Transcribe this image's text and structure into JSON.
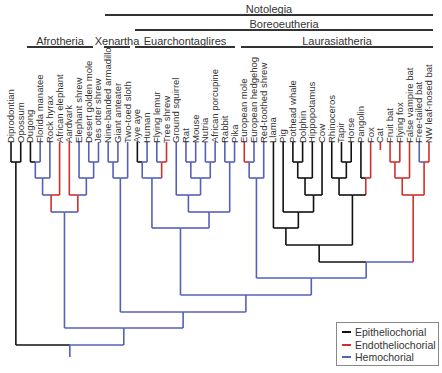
{
  "clades": [
    {
      "label": "Notolegia",
      "x1": 105,
      "x2": 433,
      "y_bar": 14,
      "y_label": 3
    },
    {
      "label": "Boreoeutheria",
      "x1": 135,
      "x2": 433,
      "y_bar": 29,
      "y_label": 18
    },
    {
      "label": "Afrotheria",
      "x1": 27,
      "x2": 93,
      "y_bar": 46,
      "y_label": 35
    },
    {
      "label": "Xenartha",
      "x1": 104,
      "x2": 130,
      "y_bar": 46,
      "y_label": 35
    },
    {
      "label": "Euarchontaglires",
      "x1": 135,
      "x2": 235,
      "y_bar": 46,
      "y_label": 35
    },
    {
      "label": "Laurasiatheria",
      "x1": 241,
      "x2": 433,
      "y_bar": 46,
      "y_label": 35
    }
  ],
  "taxa": [
    {
      "name": "Diprodontian",
      "type": "E"
    },
    {
      "name": "Opossum",
      "type": "E"
    },
    {
      "name": "Dugong",
      "type": "E"
    },
    {
      "name": "Florida manatee",
      "type": "H"
    },
    {
      "name": "Rock hyrax",
      "type": "H"
    },
    {
      "name": "African elephant",
      "type": "N"
    },
    {
      "name": "Aardvark",
      "type": "N"
    },
    {
      "name": "Elephant shrew",
      "type": "H"
    },
    {
      "name": "Desert golden mole",
      "type": "H"
    },
    {
      "name": "Jes otter shrew",
      "type": "H"
    },
    {
      "name": "Nine-banded armadillo",
      "type": "H"
    },
    {
      "name": "Giant anteater",
      "type": "H"
    },
    {
      "name": "Two-toed sloth",
      "type": "H"
    },
    {
      "name": "Aye aye",
      "type": "E"
    },
    {
      "name": "Human",
      "type": "H"
    },
    {
      "name": "Flying lemur",
      "type": "H"
    },
    {
      "name": "Tree shrew",
      "type": "N"
    },
    {
      "name": "Ground squirrel",
      "type": "H"
    },
    {
      "name": "Rat",
      "type": "H"
    },
    {
      "name": "Mouse",
      "type": "H"
    },
    {
      "name": "Nutria",
      "type": "H"
    },
    {
      "name": "African porcupine",
      "type": "H"
    },
    {
      "name": "Rabbit",
      "type": "H"
    },
    {
      "name": "Pika",
      "type": "H"
    },
    {
      "name": "European mole",
      "type": "N"
    },
    {
      "name": "European hedgehog",
      "type": "H"
    },
    {
      "name": "Red-toothed shrew",
      "type": "H"
    },
    {
      "name": "Llama",
      "type": "E"
    },
    {
      "name": "Pig",
      "type": "E"
    },
    {
      "name": "Pothead whale",
      "type": "E"
    },
    {
      "name": "Dolphin",
      "type": "E"
    },
    {
      "name": "Hippopotamus",
      "type": "E"
    },
    {
      "name": "Cow",
      "type": "E"
    },
    {
      "name": "Rhinoceros",
      "type": "E"
    },
    {
      "name": "Tapir",
      "type": "E"
    },
    {
      "name": "Horse",
      "type": "E"
    },
    {
      "name": "Pangolin",
      "type": "E"
    },
    {
      "name": "Fox",
      "type": "N"
    },
    {
      "name": "Cat",
      "type": "N"
    },
    {
      "name": "Fruit bat",
      "type": "N"
    },
    {
      "name": "Flying fox",
      "type": "N"
    },
    {
      "name": "False vampire bat",
      "type": "N"
    },
    {
      "name": "Free-tailed bat",
      "type": "H"
    },
    {
      "name": "NW leaf-nosed bat",
      "type": "N"
    }
  ],
  "legend": {
    "items": [
      {
        "key": "E",
        "label": "Epitheliochorial",
        "color": "#111111"
      },
      {
        "key": "N",
        "label": "Endotheliochorial",
        "color": "#d0302a"
      },
      {
        "key": "H",
        "label": "Hemochorial",
        "color": "#5560b8"
      }
    ]
  },
  "layout": {
    "tip_x0": 11,
    "tip_dx": 9.72,
    "tip_y": 150,
    "label_bottom": 143
  },
  "tree": [
    [
      "E",
      0,
      1,
      162,
      "a"
    ],
    [
      "E",
      2,
      3,
      162,
      "b",
      "H"
    ],
    [
      "H",
      "b",
      4,
      178,
      "c"
    ],
    [
      "H",
      "c",
      5,
      195,
      "d",
      "N"
    ],
    [
      "H",
      8,
      9,
      162,
      "e"
    ],
    [
      "H",
      "e",
      7,
      178,
      "f"
    ],
    [
      "H",
      "f",
      6,
      195,
      "g",
      "N"
    ],
    [
      "H",
      "d",
      "g",
      212,
      "afro"
    ],
    [
      "H",
      10,
      11,
      162,
      "x1"
    ],
    [
      "H",
      "x1",
      12,
      178,
      "xen"
    ],
    [
      "E",
      13,
      14,
      162,
      "p1",
      "H"
    ],
    [
      "H",
      15,
      16,
      162,
      "p2",
      "N"
    ],
    [
      "H",
      "p1",
      "p2",
      178,
      "prim"
    ],
    [
      "H",
      18,
      19,
      162,
      "r1"
    ],
    [
      "H",
      20,
      21,
      162,
      "r2"
    ],
    [
      "H",
      "r1",
      "r2",
      178,
      "r3"
    ],
    [
      "H",
      17,
      "r3",
      195,
      "rod"
    ],
    [
      "H",
      22,
      23,
      162,
      "lag"
    ],
    [
      "H",
      "rod",
      "lag",
      212,
      "glires"
    ],
    [
      "H",
      "prim",
      "glires",
      228,
      "euar"
    ],
    [
      "N",
      24,
      25,
      162,
      "eu1",
      "H"
    ],
    [
      "H",
      "eu1",
      26,
      178,
      "eul"
    ],
    [
      "E",
      29,
      30,
      162,
      "ce"
    ],
    [
      "E",
      "ce",
      31,
      178,
      "ce2"
    ],
    [
      "E",
      "ce2",
      32,
      195,
      "ce3"
    ],
    [
      "E",
      28,
      "ce3",
      212,
      "ce4"
    ],
    [
      "E",
      27,
      "ce4",
      228,
      "cet"
    ],
    [
      "E",
      34,
      35,
      162,
      "pe"
    ],
    [
      "E",
      33,
      "pe",
      178,
      "pe2"
    ],
    [
      "E",
      36,
      37,
      178,
      "cp",
      "N"
    ],
    [
      "E",
      "pe2",
      "cp",
      195,
      "fer"
    ],
    [
      "E",
      "cet",
      "fer",
      245,
      "ferung"
    ],
    [
      "N",
      39,
      40,
      162,
      "bt1"
    ],
    [
      "N",
      "bt1",
      41,
      178,
      "bt2"
    ],
    [
      "H",
      42,
      43,
      162,
      "bt3",
      "N"
    ],
    [
      "N",
      "bt2",
      "bt3",
      195,
      "bats"
    ],
    [
      "E",
      "ferung",
      "bats",
      262,
      "scro",
      "H"
    ],
    [
      "H",
      "eul",
      "scro",
      278,
      "laur"
    ],
    [
      "H",
      "euar",
      "laur",
      295,
      "boreo"
    ],
    [
      "H",
      "xen",
      "boreo",
      312,
      "noto"
    ],
    [
      "H",
      "afro",
      "noto",
      328,
      "euth"
    ],
    [
      "E",
      "a",
      "euth",
      345,
      "root",
      "H"
    ]
  ],
  "root_stem": {
    "y_end": 357,
    "type": "H"
  }
}
